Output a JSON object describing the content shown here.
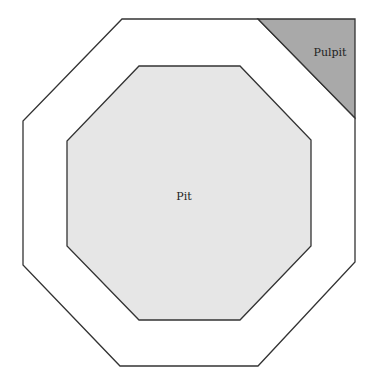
{
  "diagram": {
    "regions": [
      {
        "id": "pit",
        "label": "Pit",
        "fill": "#e6e6e6"
      },
      {
        "id": "pulpit",
        "label": "Pulpit",
        "fill": "#a9a9a9"
      }
    ],
    "stroke_color": "#333333",
    "background": "#ffffff"
  }
}
